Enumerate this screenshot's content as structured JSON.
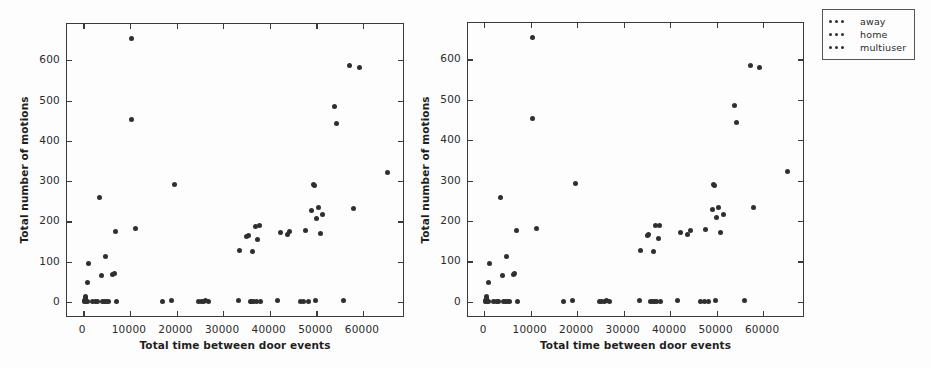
{
  "figure": {
    "background_color": "#fdfdfd",
    "marker_color": "#2f2f2f",
    "axis_color": "#3a3a3a"
  },
  "legend": {
    "position": "upper-right-outside",
    "entries": [
      {
        "label": "away",
        "marker": "dot",
        "color": "#2f2f2f"
      },
      {
        "label": "home",
        "marker": "dot",
        "color": "#2f2f2f"
      },
      {
        "label": "multiuser",
        "marker": "dot",
        "color": "#2f2f2f"
      }
    ]
  },
  "chart_data": [
    {
      "id": "left",
      "type": "scatter",
      "title": "",
      "xlabel": "Total time between door events",
      "ylabel": "Total number of motions",
      "xlim": [
        -3500,
        69000
      ],
      "ylim": [
        -40,
        690
      ],
      "xticks": [
        0,
        10000,
        20000,
        30000,
        40000,
        50000,
        60000
      ],
      "xticklabels": [
        "0",
        "10000",
        "20000",
        "30000",
        "40000",
        "50000",
        "60000"
      ],
      "yticks": [
        0,
        100,
        200,
        300,
        400,
        500,
        600
      ],
      "yticklabels": [
        "0",
        "100",
        "200",
        "300",
        "400",
        "500",
        "600"
      ],
      "grid": false,
      "legend": false,
      "points": [
        [
          300,
          0
        ],
        [
          350,
          3
        ],
        [
          380,
          8
        ],
        [
          420,
          14
        ],
        [
          500,
          2
        ],
        [
          560,
          6
        ],
        [
          900,
          0
        ],
        [
          1000,
          48
        ],
        [
          1100,
          96
        ],
        [
          1900,
          0
        ],
        [
          2600,
          0
        ],
        [
          3100,
          0
        ],
        [
          3500,
          258
        ],
        [
          3900,
          66
        ],
        [
          4200,
          0
        ],
        [
          4500,
          0
        ],
        [
          4800,
          112
        ],
        [
          5000,
          0
        ],
        [
          5400,
          0
        ],
        [
          6300,
          68
        ],
        [
          6600,
          71
        ],
        [
          6900,
          176
        ],
        [
          7100,
          0
        ],
        [
          10400,
          655
        ],
        [
          10300,
          453
        ],
        [
          11300,
          181
        ],
        [
          17000,
          2
        ],
        [
          19000,
          3
        ],
        [
          19600,
          292
        ],
        [
          24700,
          0
        ],
        [
          25300,
          2
        ],
        [
          25800,
          0
        ],
        [
          26300,
          3
        ],
        [
          26900,
          1
        ],
        [
          33300,
          3
        ],
        [
          33600,
          128
        ],
        [
          35100,
          163
        ],
        [
          35400,
          166
        ],
        [
          35800,
          0
        ],
        [
          36100,
          2
        ],
        [
          36300,
          125
        ],
        [
          36600,
          1
        ],
        [
          36900,
          188
        ],
        [
          37100,
          0
        ],
        [
          37400,
          156
        ],
        [
          37800,
          190
        ],
        [
          38000,
          2
        ],
        [
          41600,
          3
        ],
        [
          42300,
          172
        ],
        [
          43700,
          167
        ],
        [
          44300,
          176
        ],
        [
          46600,
          0
        ],
        [
          47300,
          2
        ],
        [
          47600,
          178
        ],
        [
          48200,
          1
        ],
        [
          49000,
          228
        ],
        [
          49300,
          291
        ],
        [
          49500,
          288
        ],
        [
          49700,
          3
        ],
        [
          50000,
          208
        ],
        [
          50400,
          234
        ],
        [
          50900,
          171
        ],
        [
          51400,
          217
        ],
        [
          53800,
          486
        ],
        [
          54200,
          444
        ],
        [
          55900,
          4
        ],
        [
          57200,
          586
        ],
        [
          57900,
          233
        ],
        [
          59200,
          581
        ],
        [
          65200,
          322
        ]
      ]
    },
    {
      "id": "right",
      "type": "scatter",
      "title": "",
      "xlabel": "Total time between door events",
      "ylabel": "Total number of motions",
      "xlim": [
        -3500,
        69000
      ],
      "ylim": [
        -40,
        690
      ],
      "xticks": [
        0,
        10000,
        20000,
        30000,
        40000,
        50000,
        60000
      ],
      "xticklabels": [
        "0",
        "10000",
        "20000",
        "30000",
        "40000",
        "50000",
        "60000"
      ],
      "yticks": [
        0,
        100,
        200,
        300,
        400,
        500,
        600
      ],
      "yticklabels": [
        "0",
        "100",
        "200",
        "300",
        "400",
        "500",
        "600"
      ],
      "grid": false,
      "legend": true,
      "points": [
        [
          300,
          0
        ],
        [
          350,
          3
        ],
        [
          380,
          8
        ],
        [
          420,
          14
        ],
        [
          500,
          2
        ],
        [
          560,
          6
        ],
        [
          900,
          0
        ],
        [
          1000,
          48
        ],
        [
          1100,
          96
        ],
        [
          1900,
          0
        ],
        [
          2600,
          0
        ],
        [
          3100,
          0
        ],
        [
          3500,
          258
        ],
        [
          3900,
          66
        ],
        [
          4200,
          0
        ],
        [
          4500,
          0
        ],
        [
          4800,
          112
        ],
        [
          5000,
          0
        ],
        [
          5400,
          0
        ],
        [
          6300,
          68
        ],
        [
          6600,
          71
        ],
        [
          6900,
          176
        ],
        [
          7100,
          0
        ],
        [
          10400,
          655
        ],
        [
          10300,
          453
        ],
        [
          11300,
          181
        ],
        [
          17000,
          2
        ],
        [
          19000,
          3
        ],
        [
          19600,
          292
        ],
        [
          24700,
          0
        ],
        [
          25300,
          2
        ],
        [
          25800,
          0
        ],
        [
          26300,
          3
        ],
        [
          26900,
          1
        ],
        [
          33300,
          3
        ],
        [
          33600,
          128
        ],
        [
          35100,
          163
        ],
        [
          35400,
          166
        ],
        [
          35800,
          0
        ],
        [
          36100,
          2
        ],
        [
          36300,
          125
        ],
        [
          36600,
          1
        ],
        [
          36900,
          188
        ],
        [
          37100,
          0
        ],
        [
          37400,
          156
        ],
        [
          37800,
          190
        ],
        [
          38000,
          2
        ],
        [
          41600,
          3
        ],
        [
          42300,
          172
        ],
        [
          43700,
          167
        ],
        [
          44300,
          176
        ],
        [
          46600,
          0
        ],
        [
          47300,
          2
        ],
        [
          47600,
          178
        ],
        [
          48200,
          1
        ],
        [
          49000,
          228
        ],
        [
          49300,
          291
        ],
        [
          49500,
          288
        ],
        [
          49700,
          3
        ],
        [
          50000,
          208
        ],
        [
          50400,
          234
        ],
        [
          50900,
          171
        ],
        [
          51400,
          217
        ],
        [
          53800,
          486
        ],
        [
          54200,
          444
        ],
        [
          55900,
          4
        ],
        [
          57200,
          586
        ],
        [
          57900,
          233
        ],
        [
          59200,
          581
        ],
        [
          65200,
          322
        ]
      ]
    }
  ]
}
